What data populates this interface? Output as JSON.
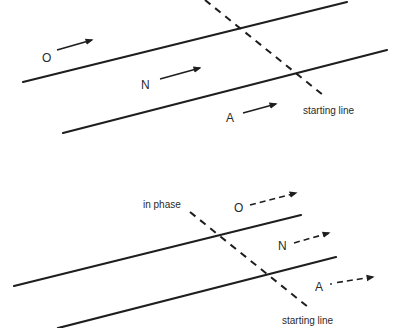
{
  "colors": {
    "ink": "#1e1e1e",
    "text": "#2a2a2a",
    "background": "#ffffff"
  },
  "top_panel": {
    "description": "Out of phase: light rays O, N, A travel with solid arrows; dashed starting line crosses two parallel lines",
    "rays": [
      {
        "label": "O",
        "arrow_style": "solid"
      },
      {
        "label": "N",
        "arrow_style": "solid"
      },
      {
        "label": "A",
        "arrow_style": "solid"
      }
    ],
    "dashed_line_label": "starting line"
  },
  "bottom_panel": {
    "description": "In phase: rays O, N, A with dashed arrows; dashed starting line crosses two parallel lines",
    "rays": [
      {
        "label": "O",
        "arrow_style": "dashed"
      },
      {
        "label": "N",
        "arrow_style": "dashed"
      },
      {
        "label": "A",
        "arrow_style": "dotted-dashed"
      }
    ],
    "phase_label": "in phase",
    "dashed_line_label": "starting line"
  }
}
